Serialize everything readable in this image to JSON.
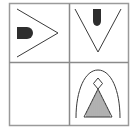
{
  "puzzle": {
    "type": "2x2 visual analogy grid",
    "colors": {
      "background": "#ffffff",
      "frame": "#9a9a9a",
      "stroke": "#3a3a3a",
      "fill": "#2e2e2e"
    },
    "cells": [
      {
        "position": "top-left",
        "content": "arrowhead-pointing-right-with-filled-D-shape-left",
        "empty": false
      },
      {
        "position": "top-right",
        "content": "V-shape-pointing-down-with-filled-D-shape-top",
        "empty": false
      },
      {
        "position": "bottom-left",
        "content": "",
        "empty": true
      },
      {
        "position": "bottom-right",
        "content": "arch-with-diamond-over-hatched-triangle",
        "empty": false
      }
    ]
  }
}
